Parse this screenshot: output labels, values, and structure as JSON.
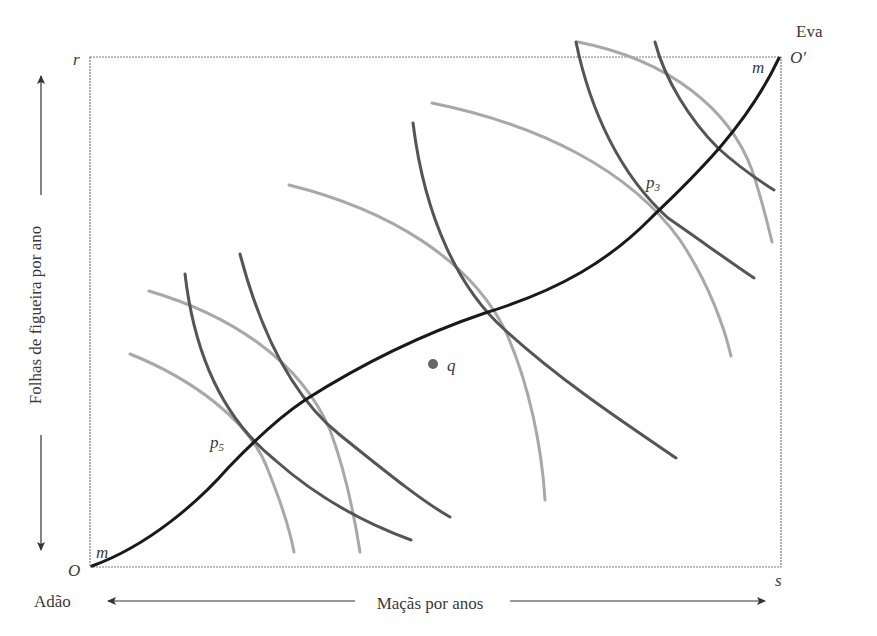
{
  "diagram": {
    "type": "edgeworth-box",
    "owners": {
      "top_right": "Eva",
      "bottom_left": "Adão"
    },
    "axes": {
      "x_label": "Maçãs por anos",
      "y_label": "Folhas de figueira por ano"
    },
    "corner_labels": {
      "origin": "O",
      "origin_prime": "O′",
      "top_left": "r",
      "bottom_right": "s"
    },
    "contract_curve": {
      "label_start": "m",
      "label_end": "m"
    },
    "points": [
      {
        "name": "p3",
        "base": "p",
        "sub": "3"
      },
      {
        "name": "p5",
        "base": "p",
        "sub": "5"
      },
      {
        "name": "q",
        "base": "q",
        "sub": ""
      }
    ],
    "colors": {
      "contract_curve": "#1a1a1a",
      "adao_indifference": "#555555",
      "eva_indifference": "#a8a8a8",
      "box": "#777777",
      "point": "#666666"
    }
  }
}
